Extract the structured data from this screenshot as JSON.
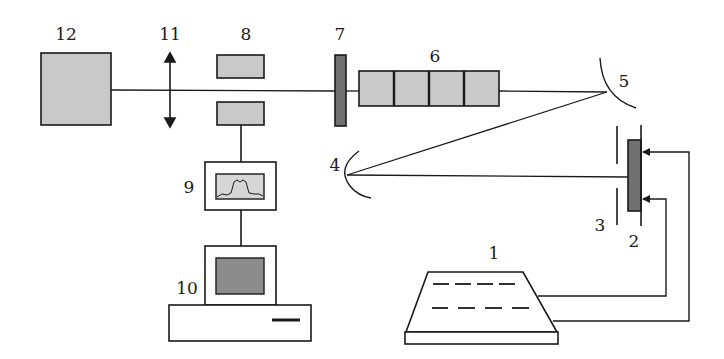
{
  "diagram": {
    "colors": {
      "stroke": "#1a1a1a",
      "light_fill": "#c9c9c9",
      "dark_fill": "#707070",
      "screen_fill": "#8c8c8c",
      "display_fill": "#d6d6d6",
      "background": "#ffffff"
    },
    "labels": {
      "c1": "1",
      "c2": "2",
      "c3": "3",
      "c4": "4",
      "c5": "5",
      "c6": "6",
      "c7": "7",
      "c8": "8",
      "c9": "9",
      "c10": "10",
      "c11": "11",
      "c12": "12"
    },
    "components": [
      {
        "id": "1",
        "shape": "trapezoid device with dashed lines (power supply / controller)"
      },
      {
        "id": "2",
        "shape": "dark vertical bar with electrodes (source / emitter)"
      },
      {
        "id": "3",
        "shape": "aperture slit (two vertical segments)"
      },
      {
        "id": "4",
        "shape": "concave mirror"
      },
      {
        "id": "5",
        "shape": "concave mirror"
      },
      {
        "id": "6",
        "shape": "four-segment gray block"
      },
      {
        "id": "7",
        "shape": "dark vertical plate"
      },
      {
        "id": "8",
        "shape": "two gray blocks (detector pair)"
      },
      {
        "id": "9",
        "shape": "display box with spectrum trace"
      },
      {
        "id": "10",
        "shape": "computer (monitor and base unit)"
      },
      {
        "id": "11",
        "shape": "lens (double-headed arrow)"
      },
      {
        "id": "12",
        "shape": "large gray square"
      }
    ]
  }
}
